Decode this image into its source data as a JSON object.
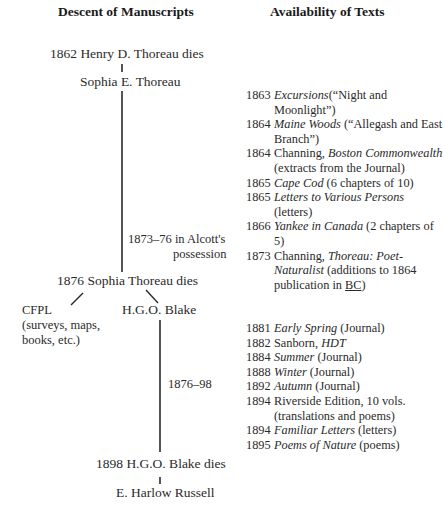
{
  "headings": {
    "left": "Descent of Manuscripts",
    "right": "Availability of Texts"
  },
  "descent": {
    "node_1862": "1862 Henry D. Thoreau dies",
    "node_sophia": "Sophia E. Thoreau",
    "alcott_line1": "1873–76 in Alcott's",
    "alcott_line2": "possession",
    "node_1876": "1876 Sophia Thoreau dies",
    "cfpl_line1": "CFPL",
    "cfpl_line2": "(surveys, maps,",
    "cfpl_line3": "books, etc.)",
    "node_blake": "H.G.O. Blake",
    "blake_span": "1876–98",
    "node_1898": "1898 H.G.O. Blake dies",
    "node_russell": "E. Harlow Russell"
  },
  "availability_group_1": [
    {
      "year": "1863",
      "pre": "",
      "title": "Excursions",
      "post": "(“Night and Moonlight”)"
    },
    {
      "year": "1864",
      "pre": "",
      "title": "Maine Woods",
      "post": " (“Allegash and East Branch”)"
    },
    {
      "year": "1864",
      "pre": "Channing, ",
      "title": "Boston Commonwealth",
      "post": " (extracts from the Journal)"
    },
    {
      "year": "1865",
      "pre": "",
      "title": "Cape Cod",
      "post": " (6 chapters of 10)"
    },
    {
      "year": "1865",
      "pre": "",
      "title": "Letters to Various Persons",
      "post": " (letters)"
    },
    {
      "year": "1866",
      "pre": "",
      "title": "Yankee in Canada",
      "post": " (2 chapters of 5)"
    },
    {
      "year": "1873",
      "pre": "Channing, ",
      "title": "Thoreau: Poet-Naturalist",
      "post": " (additions to 1864 publication in ",
      "abbr": "BC",
      "tail": ")"
    }
  ],
  "availability_group_2": [
    {
      "year": "1881",
      "pre": "",
      "title": "Early Spring",
      "post": " (Journal)"
    },
    {
      "year": "1882",
      "pre": "Sanborn, ",
      "title": "HDT",
      "post": ""
    },
    {
      "year": "1884",
      "pre": "",
      "title": "Summer",
      "post": " (Journal)"
    },
    {
      "year": "1888",
      "pre": "",
      "title": "Winter",
      "post": " (Journal)"
    },
    {
      "year": "1892",
      "pre": "",
      "title": "Autumn",
      "post": " (Journal)"
    },
    {
      "year": "1894",
      "pre": "Riverside Edition, 10 vols. (translations and poems)",
      "title": "",
      "post": ""
    },
    {
      "year": "1894",
      "pre": "",
      "title": "Familiar Letters",
      "post": " (letters)"
    },
    {
      "year": "1895",
      "pre": "",
      "title": "Poems of Nature",
      "post": " (poems)"
    }
  ]
}
